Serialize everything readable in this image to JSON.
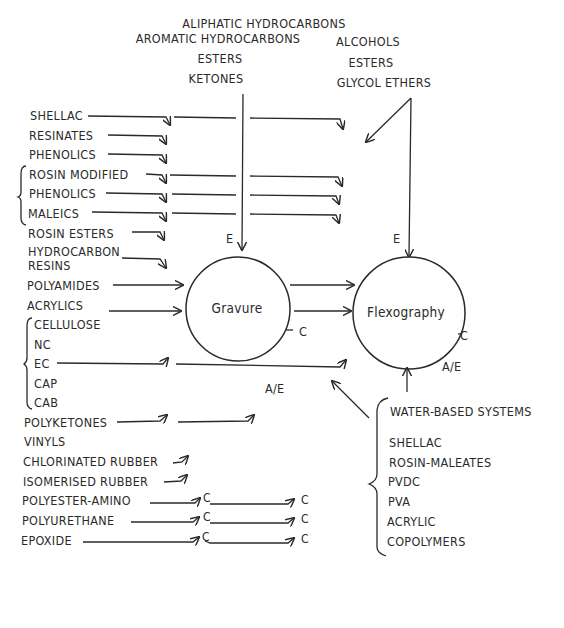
{
  "solvents": {
    "gravure": [
      "ALIPHATIC HYDROCARBONS",
      "AROMATIC HYDROCARBONS",
      "ESTERS",
      "KETONES"
    ],
    "flexography": [
      "ALCOHOLS",
      "ESTERS",
      "GLYCOL ETHERS"
    ]
  },
  "processes": {
    "gravure": "Gravure",
    "flexography": "Flexography"
  },
  "resins": [
    {
      "label": "SHELLAC",
      "targets": "both"
    },
    {
      "label": "RESINATES",
      "targets": "gravure"
    },
    {
      "label": "PHENOLICS",
      "targets": "gravure"
    },
    {
      "label": "ROSIN MODIFIED",
      "targets": "both",
      "group": "rosin-modified"
    },
    {
      "label": "PHENOLICS",
      "targets": "both",
      "group": "rosin-modified"
    },
    {
      "label": "MALEICS",
      "targets": "both",
      "group": "rosin-modified"
    },
    {
      "label": "ROSIN ESTERS",
      "targets": "gravure"
    },
    {
      "label": "HYDROCARBON",
      "label2": "RESINS",
      "targets": "gravure"
    },
    {
      "label": "POLYAMIDES",
      "targets": "both"
    },
    {
      "label": "ACRYLICS",
      "targets": "both"
    },
    {
      "label": "CELLULOSE",
      "targets": "both",
      "group": "cellulose"
    },
    {
      "label": "NC",
      "group": "cellulose"
    },
    {
      "label": "EC",
      "group": "cellulose"
    },
    {
      "label": "CAP",
      "group": "cellulose"
    },
    {
      "label": "CAB",
      "group": "cellulose"
    },
    {
      "label": "POLYKETONES",
      "targets": "both"
    },
    {
      "label": "VINYLS"
    },
    {
      "label": "CHLORINATED RUBBER",
      "targets": "gravure"
    },
    {
      "label": "ISOMERISED RUBBER",
      "targets": "gravure"
    },
    {
      "label": "POLYESTER-AMINO",
      "targets": "both",
      "mark": "C"
    },
    {
      "label": "POLYURETHANE",
      "targets": "both",
      "mark": "C"
    },
    {
      "label": "EPOXIDE",
      "targets": "both",
      "mark": "C"
    }
  ],
  "annotations": {
    "e_gravure": "E",
    "e_flexo": "E",
    "c_gravure": "C",
    "c_flexo": "C",
    "ae_gravure": "A/E",
    "ae_flexo": "A/E",
    "c_mark": "C"
  },
  "water_based": {
    "title": "WATER-BASED SYSTEMS",
    "items": [
      "SHELLAC",
      "ROSIN-MALEATES",
      "PVDC",
      "PVA",
      "ACRYLIC",
      "COPOLYMERS"
    ]
  }
}
